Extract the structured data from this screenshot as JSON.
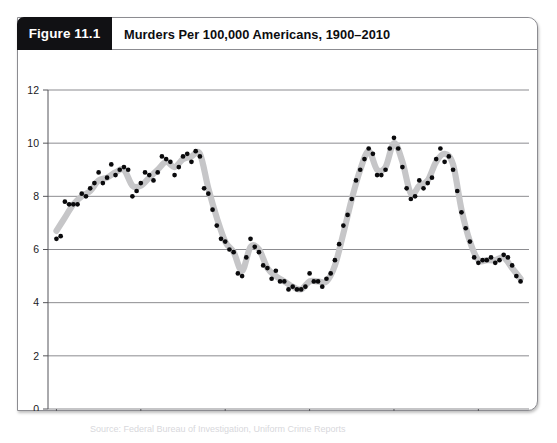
{
  "figure": {
    "tag": "Figure 11.1",
    "title": "Murders Per 100,000 Americans, 1900–2010",
    "caption_faint": "Source: Federal Bureau of Investigation, Uniform Crime Reports"
  },
  "chart_data": {
    "type": "scatter",
    "title": "Murders Per 100,000 Americans, 1900–2010",
    "xlabel": "",
    "ylabel": "",
    "xlim": [
      1898,
      2012
    ],
    "ylim": [
      0,
      12
    ],
    "xticks": [
      1900,
      1920,
      1940,
      1960,
      1980,
      2000
    ],
    "yticks": [
      0,
      2,
      4,
      6,
      8,
      10,
      12
    ],
    "grid": true,
    "legend": null,
    "series": [
      {
        "name": "Murder rate per 100,000",
        "marker": "filled-circle",
        "marker_color": "#0a0a0c",
        "x": [
          1900,
          1901,
          1902,
          1903,
          1904,
          1905,
          1906,
          1907,
          1908,
          1909,
          1910,
          1911,
          1912,
          1913,
          1914,
          1915,
          1916,
          1917,
          1918,
          1919,
          1920,
          1921,
          1922,
          1923,
          1924,
          1925,
          1926,
          1927,
          1928,
          1929,
          1930,
          1931,
          1932,
          1933,
          1934,
          1935,
          1936,
          1937,
          1938,
          1939,
          1940,
          1941,
          1942,
          1943,
          1944,
          1945,
          1946,
          1947,
          1948,
          1949,
          1950,
          1951,
          1952,
          1953,
          1954,
          1955,
          1956,
          1957,
          1958,
          1959,
          1960,
          1961,
          1962,
          1963,
          1964,
          1965,
          1966,
          1967,
          1968,
          1969,
          1970,
          1971,
          1972,
          1973,
          1974,
          1975,
          1976,
          1977,
          1978,
          1979,
          1980,
          1981,
          1982,
          1983,
          1984,
          1985,
          1986,
          1987,
          1988,
          1989,
          1990,
          1991,
          1992,
          1993,
          1994,
          1995,
          1996,
          1997,
          1998,
          1999,
          2000,
          2001,
          2002,
          2003,
          2004,
          2005,
          2006,
          2007,
          2008,
          2009,
          2010
        ],
        "y": [
          6.4,
          6.5,
          7.8,
          7.7,
          7.7,
          7.7,
          8.1,
          8.0,
          8.3,
          8.5,
          8.9,
          8.5,
          8.7,
          9.2,
          8.8,
          9.0,
          9.1,
          9.0,
          8.0,
          8.2,
          8.5,
          8.9,
          8.8,
          8.6,
          8.9,
          9.5,
          9.4,
          9.3,
          8.8,
          9.1,
          9.5,
          9.6,
          9.3,
          9.7,
          9.5,
          8.3,
          8.1,
          7.5,
          6.9,
          6.4,
          6.3,
          6.0,
          5.9,
          5.1,
          5.0,
          5.7,
          6.4,
          6.1,
          5.9,
          5.4,
          5.3,
          4.9,
          5.2,
          4.8,
          4.8,
          4.5,
          4.6,
          4.5,
          4.5,
          4.6,
          5.1,
          4.8,
          4.8,
          4.6,
          4.9,
          5.1,
          5.6,
          6.2,
          6.9,
          7.3,
          7.9,
          8.6,
          9.0,
          9.4,
          9.8,
          9.6,
          8.8,
          8.8,
          9.0,
          9.8,
          10.2,
          9.8,
          9.1,
          8.3,
          7.9,
          8.0,
          8.6,
          8.3,
          8.5,
          8.7,
          9.4,
          9.8,
          9.3,
          9.5,
          9.0,
          8.2,
          7.4,
          6.8,
          6.3,
          5.7,
          5.5,
          5.6,
          5.6,
          5.7,
          5.5,
          5.6,
          5.8,
          5.7,
          5.4,
          5.0,
          4.8
        ]
      },
      {
        "name": "Smoothed trend",
        "line_color": "#c6c6c8",
        "line_width": 6.2,
        "x": [
          1900,
          1902,
          1904,
          1906,
          1908,
          1910,
          1912,
          1914,
          1916,
          1918,
          1920,
          1922,
          1924,
          1926,
          1928,
          1930,
          1932,
          1934,
          1936,
          1938,
          1940,
          1942,
          1944,
          1946,
          1948,
          1950,
          1952,
          1954,
          1956,
          1958,
          1960,
          1962,
          1964,
          1966,
          1968,
          1970,
          1972,
          1974,
          1976,
          1978,
          1980,
          1982,
          1984,
          1986,
          1988,
          1990,
          1992,
          1994,
          1996,
          1998,
          2000,
          2002,
          2004,
          2006,
          2008,
          2010
        ],
        "y": [
          6.7,
          7.2,
          7.7,
          8.0,
          8.2,
          8.6,
          8.7,
          8.9,
          9.0,
          8.4,
          8.4,
          8.7,
          9.0,
          9.3,
          9.1,
          9.4,
          9.5,
          9.6,
          8.3,
          7.2,
          6.3,
          5.9,
          5.2,
          6.1,
          6.0,
          5.3,
          5.0,
          4.8,
          4.6,
          4.5,
          4.8,
          4.8,
          4.8,
          5.4,
          6.6,
          7.9,
          9.0,
          9.7,
          9.0,
          9.1,
          10.0,
          9.3,
          8.1,
          8.4,
          8.6,
          9.3,
          9.6,
          9.2,
          7.5,
          6.3,
          5.6,
          5.6,
          5.6,
          5.7,
          5.3,
          4.9
        ]
      }
    ]
  }
}
